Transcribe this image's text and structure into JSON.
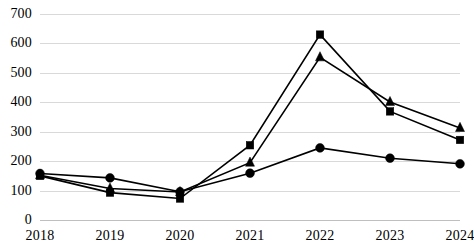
{
  "chart_data": {
    "type": "line",
    "title": "",
    "subtitle": "",
    "xlabel": "",
    "ylabel": "",
    "categories": [
      "2018",
      "2019",
      "2020",
      "2021",
      "2022",
      "2023",
      "2024"
    ],
    "ylim": [
      0,
      700
    ],
    "y_ticks": [
      0,
      100,
      200,
      300,
      400,
      500,
      600,
      700
    ],
    "y_tick_labels": [
      "0",
      "100",
      "200",
      "300",
      "400",
      "500",
      "600",
      "700"
    ],
    "grid": true,
    "legend": "none",
    "series": [
      {
        "name": "Series 1",
        "marker": "square",
        "color": "#000000",
        "values": [
          150,
          93,
          73,
          254,
          630,
          369,
          272
        ]
      },
      {
        "name": "Series 2",
        "marker": "triangle",
        "color": "#000000",
        "values": [
          152,
          107,
          95,
          195,
          553,
          401,
          313
        ]
      },
      {
        "name": "Series 3",
        "marker": "circle",
        "color": "#000000",
        "values": [
          158,
          143,
          96,
          159,
          245,
          210,
          191
        ]
      }
    ]
  }
}
